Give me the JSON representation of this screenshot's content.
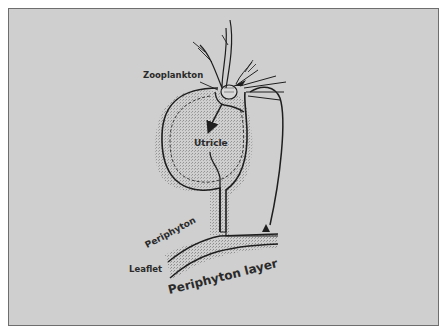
{
  "diagram": {
    "labels": {
      "zooplankton": "Zooplankton",
      "utricle": "Utricle",
      "periphyton": "Periphyton",
      "leaflet": "Leaflet",
      "periphyton_layer": "Periphyton layer"
    },
    "colors": {
      "background": "#cfcfcf",
      "frame_border": "#6e6e6e",
      "stroke": "#1e1e1e",
      "stipple": "#9a9a9a"
    }
  }
}
